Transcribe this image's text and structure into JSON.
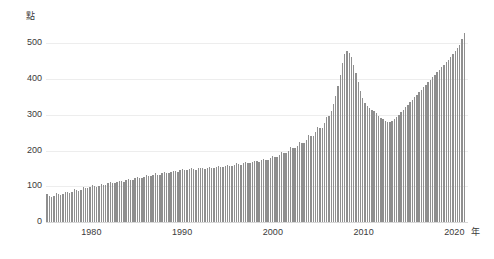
{
  "chart_data": {
    "type": "bar",
    "title": "",
    "subtitle": "",
    "xlabel": "年",
    "ylabel": "點",
    "xlim": [
      1975,
      2021.5
    ],
    "ylim": [
      0,
      560
    ],
    "yticks": [
      0,
      100,
      200,
      300,
      400,
      500
    ],
    "ytick_labels": [
      "0",
      "100",
      "200",
      "300",
      "400",
      "500"
    ],
    "xticks": [
      1980,
      1990,
      2000,
      2010,
      2020
    ],
    "xtick_labels": [
      "1980",
      "1990",
      "2000",
      "2010",
      "2020"
    ],
    "grid": "horizontal",
    "legend": "none",
    "bar_color": "#8f8f8f",
    "gridline_color": "#ededed",
    "axis_color": "#d8d8d8",
    "text_color": "#3a3a3a",
    "series": [
      {
        "name": "指數",
        "unit": "點",
        "x": [
          1975.0,
          1975.25,
          1975.5,
          1975.75,
          1976.0,
          1976.25,
          1976.5,
          1976.75,
          1977.0,
          1977.25,
          1977.5,
          1977.75,
          1978.0,
          1978.25,
          1978.5,
          1978.75,
          1979.0,
          1979.25,
          1979.5,
          1979.75,
          1980.0,
          1980.25,
          1980.5,
          1980.75,
          1981.0,
          1981.25,
          1981.5,
          1981.75,
          1982.0,
          1982.25,
          1982.5,
          1982.75,
          1983.0,
          1983.25,
          1983.5,
          1983.75,
          1984.0,
          1984.25,
          1984.5,
          1984.75,
          1985.0,
          1985.25,
          1985.5,
          1985.75,
          1986.0,
          1986.25,
          1986.5,
          1986.75,
          1987.0,
          1987.25,
          1987.5,
          1987.75,
          1988.0,
          1988.25,
          1988.5,
          1988.75,
          1989.0,
          1989.25,
          1989.5,
          1989.75,
          1990.0,
          1990.25,
          1990.5,
          1990.75,
          1991.0,
          1991.25,
          1991.5,
          1991.75,
          1992.0,
          1992.25,
          1992.5,
          1992.75,
          1993.0,
          1993.25,
          1993.5,
          1993.75,
          1994.0,
          1994.25,
          1994.5,
          1994.75,
          1995.0,
          1995.25,
          1995.5,
          1995.75,
          1996.0,
          1996.25,
          1996.5,
          1996.75,
          1997.0,
          1997.25,
          1997.5,
          1997.75,
          1998.0,
          1998.25,
          1998.5,
          1998.75,
          1999.0,
          1999.25,
          1999.5,
          1999.75,
          2000.0,
          2000.25,
          2000.5,
          2000.75,
          2001.0,
          2001.25,
          2001.5,
          2001.75,
          2002.0,
          2002.25,
          2002.5,
          2002.75,
          2003.0,
          2003.25,
          2003.5,
          2003.75,
          2004.0,
          2004.25,
          2004.5,
          2004.75,
          2005.0,
          2005.25,
          2005.5,
          2005.75,
          2006.0,
          2006.25,
          2006.5,
          2006.75,
          2007.0,
          2007.25,
          2007.5,
          2007.75,
          2008.0,
          2008.25,
          2008.5,
          2008.75,
          2009.0,
          2009.25,
          2009.5,
          2009.75,
          2010.0,
          2010.25,
          2010.5,
          2010.75,
          2011.0,
          2011.25,
          2011.5,
          2011.75,
          2012.0,
          2012.25,
          2012.5,
          2012.75,
          2013.0,
          2013.25,
          2013.5,
          2013.75,
          2014.0,
          2014.25,
          2014.5,
          2014.75,
          2015.0,
          2015.25,
          2015.5,
          2015.75,
          2016.0,
          2016.25,
          2016.5,
          2016.75,
          2017.0,
          2017.25,
          2017.5,
          2017.75,
          2018.0,
          2018.25,
          2018.5,
          2018.75,
          2019.0,
          2019.25,
          2019.5,
          2019.75,
          2020.0,
          2020.25,
          2020.5,
          2020.75,
          2021.0,
          2021.25
        ],
        "values": [
          78,
          74,
          71,
          73,
          80,
          78,
          76,
          79,
          85,
          83,
          81,
          84,
          92,
          89,
          88,
          91,
          97,
          95,
          94,
          97,
          103,
          101,
          99,
          102,
          107,
          105,
          104,
          108,
          112,
          110,
          109,
          112,
          116,
          114,
          113,
          117,
          121,
          119,
          118,
          122,
          126,
          124,
          123,
          127,
          131,
          129,
          128,
          132,
          136,
          133,
          132,
          136,
          140,
          138,
          137,
          141,
          144,
          142,
          141,
          145,
          148,
          146,
          145,
          148,
          150,
          148,
          147,
          150,
          152,
          150,
          149,
          152,
          154,
          152,
          151,
          154,
          156,
          154,
          153,
          157,
          160,
          158,
          157,
          161,
          164,
          162,
          161,
          165,
          168,
          166,
          165,
          169,
          172,
          170,
          169,
          173,
          177,
          175,
          174,
          179,
          185,
          183,
          182,
          188,
          196,
          194,
          193,
          200,
          209,
          207,
          206,
          214,
          224,
          222,
          221,
          231,
          243,
          241,
          240,
          252,
          266,
          264,
          263,
          277,
          295,
          298,
          312,
          330,
          352,
          380,
          412,
          446,
          470,
          478,
          474,
          462,
          441,
          418,
          392,
          368,
          348,
          334,
          324,
          318,
          314,
          310,
          305,
          298,
          292,
          288,
          284,
          281,
          280,
          283,
          288,
          294,
          300,
          307,
          314,
          321,
          329,
          336,
          343,
          350,
          357,
          364,
          371,
          378,
          385,
          392,
          399,
          406,
          413,
          420,
          427,
          434,
          441,
          448,
          455,
          462,
          470,
          478,
          487,
          497,
          512,
          530
        ]
      }
    ],
    "annotations": [
      {
        "label": "peak",
        "x": 2007.3,
        "value": 478
      },
      {
        "label": "trough",
        "x": 2012.0,
        "value": 280
      },
      {
        "label": "latest",
        "x": 2021.25,
        "value": 530
      }
    ]
  },
  "axes": {
    "y_unit": "點",
    "x_unit": "年"
  }
}
